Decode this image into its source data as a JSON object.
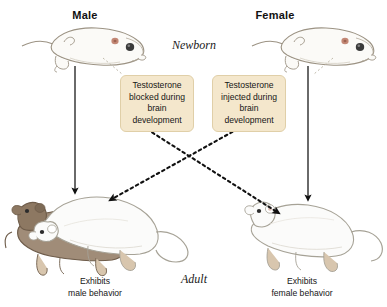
{
  "figure": {
    "title_male": "Male",
    "title_female": "Female",
    "stage_top": "Newborn",
    "stage_bottom": "Adult",
    "background_color": "#ffffff"
  },
  "columns": [
    {
      "sex": "Male",
      "header": "Male",
      "treatment_line1": "Testosterone",
      "treatment_line2": "blocked during",
      "treatment_line3": "brain development",
      "outcome_line1": "Exhibits",
      "outcome_line2": "male behavior"
    },
    {
      "sex": "Female",
      "header": "Female",
      "treatment_line1": "Testosterone",
      "treatment_line2": "injected during",
      "treatment_line3": "brain development",
      "outcome_line1": "Exhibits",
      "outcome_line2": "female behavior"
    }
  ],
  "callouts": [
    {
      "name": "testosterone-blocked",
      "line1": "Testosterone",
      "line2": "blocked during",
      "line3": "brain development",
      "fill": "#f4e7cc",
      "border": "#e0cfa8"
    },
    {
      "name": "testosterone-injected",
      "line1": "Testosterone",
      "line2": "injected during",
      "line3": "brain development",
      "fill": "#f4e7cc",
      "border": "#e0cfa8"
    }
  ],
  "captions": [
    {
      "name": "male-behavior-caption",
      "line1": "Exhibits",
      "line2": "male behavior"
    },
    {
      "name": "female-behavior-caption",
      "line1": "Exhibits",
      "line2": "female behavior"
    }
  ],
  "arrows": {
    "solid_color": "#111111",
    "dashed_color": "#111111",
    "leader_color": "#b9b2a2",
    "descriptions": {
      "left_solid": "male newborn to male adult",
      "right_solid": "female newborn to female adult",
      "left_dashed_cross": "male newborn treated to female-type adult",
      "right_dashed_cross": "female newborn treated to male-type adult"
    }
  },
  "illustrations": {
    "newborn_male": "hairless newborn mouse pup",
    "newborn_female": "hairless newborn mouse pup",
    "adult_left": "white adult mouse mounting brown adult mouse",
    "adult_right": "white adult mouse in lordosis posture",
    "pup_body_fill": "#fbfaf7",
    "pup_outline": "#9c9384",
    "adult_white_fill": "#fbfbfa",
    "adult_white_outline": "#a6a296",
    "adult_brown_fill": "#a08c78",
    "adult_brown_outline": "#6e5c4a",
    "limb_fill": "#d8c6ae",
    "eye_fill": "#3a3a3a",
    "ear_fill": "#b8735e"
  }
}
